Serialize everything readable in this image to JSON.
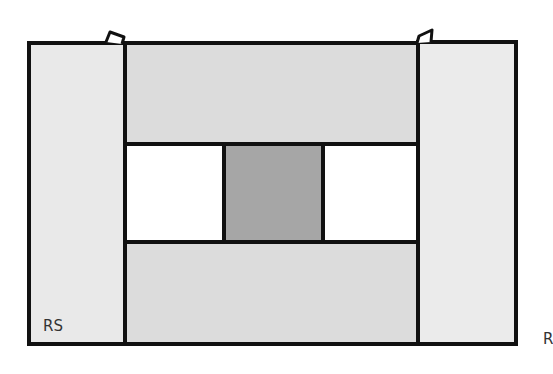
{
  "diagram": {
    "type": "quilt-block-construction",
    "labels": {
      "right_side_label": "RS",
      "cut_off_label": "R"
    },
    "colors": {
      "outline": "#111111",
      "side_strip": "#e9e9e9",
      "top_bottom_strip": "#dcdcdc",
      "center_square": "#a6a6a6",
      "side_squares": "#ffffff"
    },
    "pieces": [
      {
        "name": "left-strip",
        "fill": "side_strip"
      },
      {
        "name": "top-strip",
        "fill": "top_bottom_strip"
      },
      {
        "name": "left-white-square",
        "fill": "side_squares"
      },
      {
        "name": "center-gray-square",
        "fill": "center_square"
      },
      {
        "name": "right-white-square",
        "fill": "side_squares"
      },
      {
        "name": "bottom-strip",
        "fill": "top_bottom_strip"
      },
      {
        "name": "right-strip",
        "fill": "side_strip"
      }
    ]
  }
}
